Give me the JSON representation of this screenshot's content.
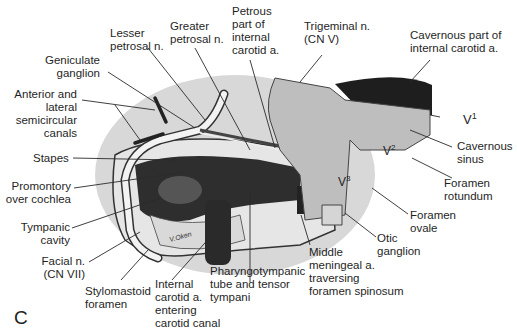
{
  "figure": {
    "panel_letter": "C",
    "colors": {
      "background": "#ffffff",
      "bone_shadow": "#cfcfcf",
      "dark_cavity": "#2b2b2b",
      "nerve": "#f2f2f2",
      "trigeminal": "#bdbdbd",
      "leader_line": "#2a2a2a"
    },
    "labels": {
      "lesser_petrosal": "Lesser\npetrosal n.",
      "greater_petrosal": "Greater\npetrosal n.",
      "petrous_carotid": "Petrous\npart of\ninternal\ncarotid a.",
      "trigeminal": "Trigeminal n.\n(CN V)",
      "cavernous_carotid": "Cavernous part of\ninternal carotid a.",
      "geniculate": "Geniculate\nganglion",
      "semicircular": "Anterior and\nlateral\nsemicircular\ncanals",
      "v1": "V",
      "v1_sup": "1",
      "v2": "V",
      "v2_sup": "2",
      "v3": "V",
      "v3_sup": "3",
      "cavernous_sinus": "Cavernous\nsinus",
      "stapes": "Stapes",
      "promontory": "Promontory\nover cochlea",
      "foramen_rotundum": "Foramen\nrotundum",
      "foramen_ovale": "Foramen\novale",
      "tympanic_cavity": "Tympanic\ncavity",
      "otic_ganglion": "Otic\nganglion",
      "facial": "Facial n.\n(CN VII)",
      "middle_meningeal": "Middle\nmeningeal a.\ntraversing\nforamen spinosum",
      "stylomastoid": "Stylomastoid\nforamen",
      "internal_carotid_entering": "Internal\ncarotid a.\nentering\ncarotid canal",
      "pharyngotympanic": "Pharyngotympanic\ntube and tensor\ntympani",
      "artist_signature": "V.Oken"
    }
  }
}
